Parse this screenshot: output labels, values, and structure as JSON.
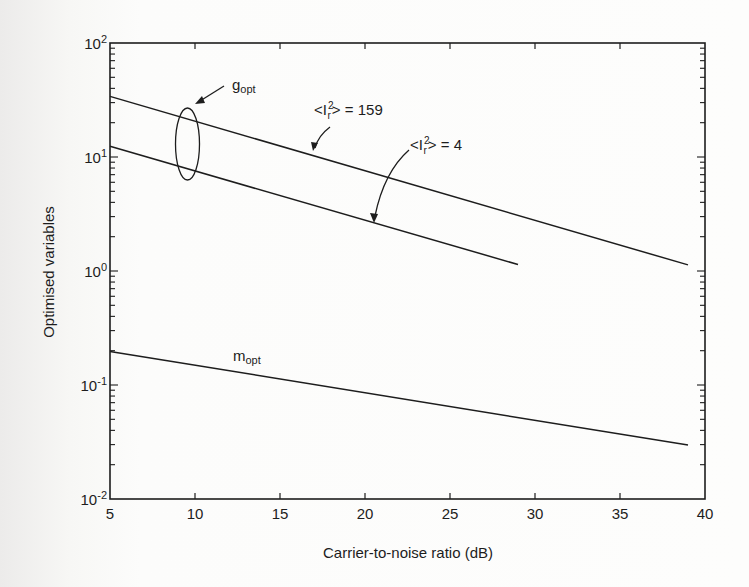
{
  "chart_data": {
    "type": "line",
    "title": "",
    "xlabel": "Carrier-to-noise ratio (dB)",
    "ylabel": "Optimised variables",
    "xscale": "linear",
    "yscale": "log",
    "xlim": [
      5,
      40
    ],
    "ylim": [
      0.01,
      100
    ],
    "xticks": [
      5,
      10,
      15,
      20,
      25,
      30,
      35,
      40
    ],
    "xtick_labels": [
      "5",
      "10",
      "15",
      "20",
      "25",
      "30",
      "35",
      "40"
    ],
    "yticks": [
      {
        "base": "10",
        "exp": "2",
        "value": 100
      },
      {
        "base": "10",
        "exp": "1",
        "value": 10
      },
      {
        "base": "10",
        "exp": "0",
        "value": 1
      },
      {
        "base": "10",
        "exp": "-1",
        "value": 0.1
      },
      {
        "base": "10",
        "exp": "-2",
        "value": 0.01
      }
    ],
    "grid": false,
    "legend": "none (inline annotations)",
    "series": [
      {
        "name": "g_opt, <I_r^2> = 159",
        "x": [
          5,
          39
        ],
        "y": [
          34,
          1.13
        ]
      },
      {
        "name": "g_opt, <I_r^2> = 4",
        "x": [
          5,
          29
        ],
        "y": [
          12.4,
          1.14
        ]
      },
      {
        "name": "m_opt",
        "x": [
          5,
          39
        ],
        "y": [
          0.197,
          0.0297
        ]
      }
    ],
    "annotations": [
      {
        "id": "gopt",
        "main": "g",
        "sub": "opt",
        "note": "ellipse grouping both g_opt curves near x≈9.5 dB"
      },
      {
        "id": "i159",
        "prefix": "<I",
        "sup": "2",
        "sub": "r",
        "suffix": "> = 159"
      },
      {
        "id": "i4",
        "prefix": "<I",
        "sup": "2",
        "sub": "r",
        "suffix": "> = 4"
      },
      {
        "id": "mopt",
        "main": "m",
        "sub": "opt"
      }
    ]
  },
  "colors": {
    "ink": "#1d1d1d",
    "paper": "#fdfdfc"
  }
}
